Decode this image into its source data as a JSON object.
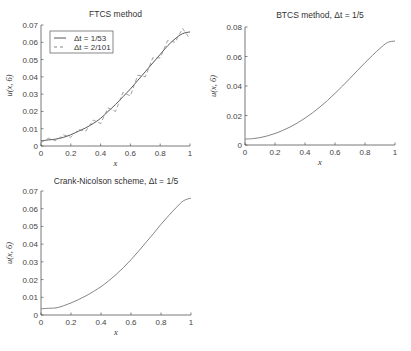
{
  "chart_data": [
    {
      "type": "line",
      "title": "FTCS method",
      "xlabel": "x",
      "ylabel": "u(x, 6)",
      "xlim": [
        0,
        1
      ],
      "ylim": [
        0,
        0.07
      ],
      "xticks": [
        "0",
        "0.2",
        "0.4",
        "0.6",
        "0.8",
        "1"
      ],
      "yticks": [
        "0",
        "0.01",
        "0.02",
        "0.03",
        "0.04",
        "0.05",
        "0.06",
        "0.07"
      ],
      "grid": false,
      "legend_position": "upper left",
      "legend": [
        "Δt = 1/53",
        "Δt = 2/101"
      ],
      "series": [
        {
          "name": "Δt = 1/53",
          "style": "solid",
          "x": [
            0,
            0.05,
            0.1,
            0.15,
            0.2,
            0.25,
            0.3,
            0.35,
            0.4,
            0.45,
            0.5,
            0.55,
            0.6,
            0.65,
            0.7,
            0.75,
            0.8,
            0.85,
            0.9,
            0.95,
            1.0
          ],
          "y": [
            0.003,
            0.0035,
            0.004,
            0.005,
            0.0065,
            0.0085,
            0.0105,
            0.013,
            0.016,
            0.02,
            0.024,
            0.0285,
            0.033,
            0.038,
            0.043,
            0.048,
            0.053,
            0.058,
            0.062,
            0.065,
            0.066
          ]
        },
        {
          "name": "Δt = 2/101",
          "style": "dashed-oscillating",
          "x": [
            0,
            0.05,
            0.1,
            0.15,
            0.2,
            0.25,
            0.3,
            0.35,
            0.4,
            0.45,
            0.5,
            0.55,
            0.6,
            0.65,
            0.7,
            0.75,
            0.8,
            0.85,
            0.9,
            0.95,
            1.0
          ],
          "y": [
            0.002,
            0.0045,
            0.003,
            0.0065,
            0.005,
            0.0095,
            0.0085,
            0.015,
            0.013,
            0.022,
            0.02,
            0.031,
            0.029,
            0.041,
            0.04,
            0.051,
            0.051,
            0.061,
            0.06,
            0.068,
            0.062
          ]
        }
      ]
    },
    {
      "type": "line",
      "title": "BTCS method,  Δt = 1/5",
      "xlabel": "x",
      "ylabel": "u(x, 6)",
      "xlim": [
        0,
        1
      ],
      "ylim": [
        0,
        0.08
      ],
      "xticks": [
        "0",
        "0.2",
        "0.4",
        "0.6",
        "0.8",
        "1"
      ],
      "yticks": [
        "0",
        "0.02",
        "0.04",
        "0.06",
        "0.08"
      ],
      "grid": false,
      "series": [
        {
          "name": "Δt = 1/5",
          "style": "solid",
          "x": [
            0,
            0.05,
            0.1,
            0.15,
            0.2,
            0.25,
            0.3,
            0.35,
            0.4,
            0.45,
            0.5,
            0.55,
            0.6,
            0.65,
            0.7,
            0.75,
            0.8,
            0.85,
            0.9,
            0.95,
            1.0
          ],
          "y": [
            0.004,
            0.0043,
            0.005,
            0.0062,
            0.0078,
            0.0098,
            0.0122,
            0.015,
            0.0182,
            0.0218,
            0.0258,
            0.0302,
            0.035,
            0.04,
            0.0452,
            0.0505,
            0.0558,
            0.0608,
            0.0655,
            0.0695,
            0.0705
          ]
        }
      ]
    },
    {
      "type": "line",
      "title": "Crank-Nicolson scheme,   Δt = 1/5",
      "xlabel": "x",
      "ylabel": "u(x, 6)",
      "xlim": [
        0,
        1
      ],
      "ylim": [
        0,
        0.07
      ],
      "xticks": [
        "0",
        "0.2",
        "0.4",
        "0.6",
        "0.8",
        "1"
      ],
      "yticks": [
        "0",
        "0.01",
        "0.02",
        "0.03",
        "0.04",
        "0.05",
        "0.06",
        "0.07"
      ],
      "grid": false,
      "series": [
        {
          "name": "Δt = 1/5",
          "style": "solid",
          "x": [
            0,
            0.05,
            0.1,
            0.15,
            0.2,
            0.25,
            0.3,
            0.35,
            0.4,
            0.45,
            0.5,
            0.55,
            0.6,
            0.65,
            0.7,
            0.75,
            0.8,
            0.85,
            0.9,
            0.95,
            1.0
          ],
          "y": [
            0.0035,
            0.0038,
            0.004,
            0.0052,
            0.0068,
            0.0087,
            0.0108,
            0.0133,
            0.016,
            0.0192,
            0.0228,
            0.0268,
            0.0312,
            0.036,
            0.041,
            0.046,
            0.0512,
            0.056,
            0.0605,
            0.0645,
            0.066
          ]
        }
      ]
    }
  ]
}
